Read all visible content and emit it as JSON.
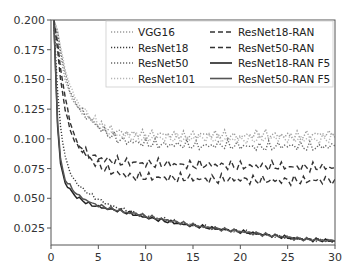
{
  "chart_data": {
    "type": "line",
    "title": "",
    "xlabel": "",
    "ylabel": "",
    "xlim": [
      0,
      30
    ],
    "ylim": [
      0.0107,
      0.2
    ],
    "grid": false,
    "legend_position": "upper right",
    "x_ticks": [
      "0",
      "5",
      "10",
      "15",
      "20",
      "25",
      "30"
    ],
    "y_ticks": [
      "0.025",
      "0.050",
      "0.075",
      "0.100",
      "0.125",
      "0.150",
      "0.175",
      "0.200"
    ],
    "x": [
      0.3,
      0.7,
      1,
      1.5,
      2,
      2.5,
      3,
      4,
      5,
      6,
      7,
      8,
      9,
      10,
      12,
      14,
      16,
      18,
      20,
      22,
      24,
      26,
      28,
      30
    ],
    "series": [
      {
        "name": "VGG16",
        "style": "dotted",
        "color": "#9a9a9a",
        "values": [
          0.2,
          0.185,
          0.17,
          0.15,
          0.138,
          0.13,
          0.125,
          0.118,
          0.112,
          0.108,
          0.106,
          0.105,
          0.104,
          0.103,
          0.104,
          0.102,
          0.104,
          0.103,
          0.102,
          0.104,
          0.103,
          0.102,
          0.104,
          0.104
        ]
      },
      {
        "name": "ResNet18",
        "style": "dotted",
        "color": "#3a3a3a",
        "values": [
          0.2,
          0.14,
          0.11,
          0.085,
          0.072,
          0.065,
          0.06,
          0.054,
          0.049,
          0.045,
          0.042,
          0.04,
          0.037,
          0.035,
          0.032,
          0.029,
          0.026,
          0.024,
          0.022,
          0.02,
          0.018,
          0.016,
          0.015,
          0.014
        ]
      },
      {
        "name": "ResNet50",
        "style": "dotted",
        "color": "#666666",
        "values": [
          0.2,
          0.19,
          0.175,
          0.155,
          0.14,
          0.132,
          0.125,
          0.117,
          0.11,
          0.104,
          0.1,
          0.098,
          0.097,
          0.096,
          0.095,
          0.095,
          0.094,
          0.095,
          0.094,
          0.093,
          0.094,
          0.094,
          0.093,
          0.094
        ]
      },
      {
        "name": "ResNet101",
        "style": "dotted",
        "color": "#b5b5b5",
        "values": [
          0.2,
          0.192,
          0.178,
          0.158,
          0.145,
          0.136,
          0.128,
          0.12,
          0.112,
          0.106,
          0.103,
          0.102,
          0.101,
          0.1,
          0.101,
          0.1,
          0.101,
          0.1,
          0.099,
          0.1,
          0.101,
          0.1,
          0.099,
          0.101
        ]
      },
      {
        "name": "ResNet18-RAN",
        "style": "dashed",
        "color": "#333333",
        "values": [
          0.2,
          0.175,
          0.15,
          0.125,
          0.108,
          0.098,
          0.092,
          0.087,
          0.084,
          0.082,
          0.081,
          0.08,
          0.08,
          0.079,
          0.079,
          0.078,
          0.078,
          0.078,
          0.077,
          0.077,
          0.077,
          0.076,
          0.076,
          0.076
        ]
      },
      {
        "name": "ResNet50-RAN",
        "style": "dashed",
        "color": "#333333",
        "values": [
          0.2,
          0.18,
          0.16,
          0.135,
          0.115,
          0.102,
          0.094,
          0.084,
          0.078,
          0.074,
          0.071,
          0.069,
          0.068,
          0.068,
          0.067,
          0.067,
          0.066,
          0.066,
          0.066,
          0.065,
          0.065,
          0.065,
          0.065,
          0.066
        ]
      },
      {
        "name": "ResNet18-RAN F5",
        "style": "solid",
        "color": "#222222",
        "values": [
          0.2,
          0.11,
          0.08,
          0.062,
          0.058,
          0.052,
          0.05,
          0.045,
          0.043,
          0.041,
          0.04,
          0.038,
          0.036,
          0.034,
          0.031,
          0.028,
          0.026,
          0.024,
          0.022,
          0.02,
          0.018,
          0.016,
          0.015,
          0.014
        ]
      },
      {
        "name": "ResNet50-RAN F5",
        "style": "solid",
        "color": "#555555",
        "values": [
          0.2,
          0.115,
          0.083,
          0.065,
          0.061,
          0.055,
          0.052,
          0.047,
          0.044,
          0.042,
          0.04,
          0.038,
          0.037,
          0.035,
          0.032,
          0.029,
          0.026,
          0.024,
          0.022,
          0.02,
          0.018,
          0.016,
          0.015,
          0.014
        ]
      }
    ]
  },
  "legend": {
    "left": [
      "VGG16",
      "ResNet18",
      "ResNet50",
      "ResNet101"
    ],
    "right": [
      "ResNet18-RAN",
      "ResNet50-RAN",
      "ResNet18-RAN F5",
      "ResNet50-RAN F5"
    ]
  }
}
